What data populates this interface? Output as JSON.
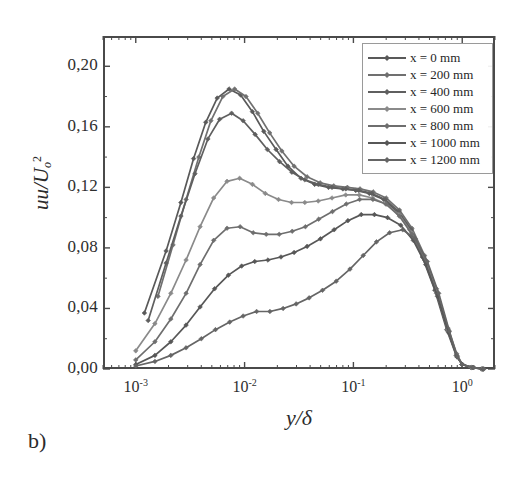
{
  "figure": {
    "panel_label": "b)",
    "background_color": "#ffffff",
    "frame_color": "#4a4a4a"
  },
  "chart_data": {
    "type": "line",
    "title": "",
    "subtitle": "",
    "xlabel": "y/δ",
    "ylabel": "uu/Uₒ²",
    "xscale": "log",
    "yscale": "linear",
    "xlim": [
      0.0005,
      2.0
    ],
    "ylim": [
      0.0,
      0.22
    ],
    "grid": false,
    "legend_position": "upper-right",
    "xtick_labels": [
      "10⁻³",
      "10⁻²",
      "10⁻¹",
      "10⁰"
    ],
    "xtick_values": [
      0.001,
      0.01,
      0.1,
      1.0
    ],
    "ytick_labels": [
      "0,00",
      "0,04",
      "0,08",
      "0,12",
      "0,16",
      "0,20"
    ],
    "ytick_values": [
      0.0,
      0.04,
      0.08,
      0.12,
      0.16,
      0.2
    ],
    "marker": "diamond",
    "series": [
      {
        "name": "x = 0 mm",
        "color": "#595959",
        "x": [
          0.0012,
          0.0019,
          0.0026,
          0.0034,
          0.0044,
          0.0056,
          0.0072,
          0.0092,
          0.0118,
          0.015,
          0.0195,
          0.025,
          0.033,
          0.044,
          0.059,
          0.08,
          0.105,
          0.14,
          0.19,
          0.25,
          0.33,
          0.43,
          0.56,
          0.72,
          0.88,
          1.0,
          1.2,
          1.5
        ],
        "y": [
          0.037,
          0.078,
          0.11,
          0.139,
          0.163,
          0.179,
          0.185,
          0.181,
          0.17,
          0.157,
          0.145,
          0.134,
          0.126,
          0.122,
          0.12,
          0.119,
          0.118,
          0.116,
          0.112,
          0.104,
          0.092,
          0.074,
          0.052,
          0.026,
          0.009,
          0.003,
          0.001,
          0.0
        ]
      },
      {
        "name": "x = 200 mm",
        "color": "#707070",
        "x": [
          0.0016,
          0.0022,
          0.0029,
          0.0038,
          0.0049,
          0.0063,
          0.0081,
          0.0103,
          0.0132,
          0.017,
          0.022,
          0.0285,
          0.0375,
          0.0495,
          0.066,
          0.088,
          0.115,
          0.152,
          0.2,
          0.265,
          0.345,
          0.45,
          0.58,
          0.74,
          0.89,
          1.0,
          1.25,
          1.55
        ],
        "y": [
          0.048,
          0.082,
          0.112,
          0.14,
          0.164,
          0.18,
          0.185,
          0.18,
          0.169,
          0.156,
          0.144,
          0.134,
          0.127,
          0.123,
          0.121,
          0.12,
          0.119,
          0.117,
          0.113,
          0.105,
          0.093,
          0.075,
          0.053,
          0.027,
          0.01,
          0.003,
          0.001,
          0.0
        ]
      },
      {
        "name": "x = 400 mm",
        "color": "#5f5f5f",
        "x": [
          0.0013,
          0.0019,
          0.0026,
          0.0035,
          0.0046,
          0.0059,
          0.0076,
          0.0097,
          0.0125,
          0.0162,
          0.021,
          0.0272,
          0.0358,
          0.0475,
          0.0635,
          0.085,
          0.112,
          0.148,
          0.196,
          0.26,
          0.34,
          0.445,
          0.575,
          0.735,
          0.885,
          1.0,
          1.22,
          1.52
        ],
        "y": [
          0.032,
          0.07,
          0.101,
          0.129,
          0.152,
          0.165,
          0.169,
          0.164,
          0.155,
          0.145,
          0.137,
          0.13,
          0.125,
          0.122,
          0.12,
          0.119,
          0.118,
          0.116,
          0.112,
          0.104,
          0.092,
          0.074,
          0.052,
          0.026,
          0.009,
          0.003,
          0.001,
          0.0
        ]
      },
      {
        "name": "x = 600 mm",
        "color": "#8a8a8a",
        "x": [
          0.001,
          0.0015,
          0.0021,
          0.0029,
          0.0039,
          0.0052,
          0.0069,
          0.009,
          0.0118,
          0.0155,
          0.0205,
          0.027,
          0.0358,
          0.0475,
          0.0635,
          0.085,
          0.113,
          0.15,
          0.198,
          0.262,
          0.342,
          0.448,
          0.578,
          0.738,
          0.888,
          1.0,
          1.23,
          1.53
        ],
        "y": [
          0.012,
          0.03,
          0.05,
          0.072,
          0.094,
          0.113,
          0.124,
          0.126,
          0.122,
          0.116,
          0.112,
          0.11,
          0.11,
          0.111,
          0.113,
          0.115,
          0.115,
          0.113,
          0.109,
          0.102,
          0.09,
          0.073,
          0.051,
          0.026,
          0.009,
          0.003,
          0.001,
          0.0
        ]
      },
      {
        "name": "x = 800 mm",
        "color": "#6e6e6e",
        "x": [
          0.001,
          0.0015,
          0.0021,
          0.0029,
          0.0039,
          0.0052,
          0.0069,
          0.0091,
          0.012,
          0.0158,
          0.0208,
          0.0274,
          0.0362,
          0.048,
          0.0642,
          0.086,
          0.114,
          0.151,
          0.2,
          0.264,
          0.345,
          0.45,
          0.58,
          0.74,
          0.89,
          1.0,
          1.24,
          1.54
        ],
        "y": [
          0.006,
          0.018,
          0.033,
          0.05,
          0.069,
          0.085,
          0.093,
          0.094,
          0.09,
          0.089,
          0.089,
          0.091,
          0.094,
          0.099,
          0.104,
          0.109,
          0.112,
          0.112,
          0.109,
          0.101,
          0.089,
          0.072,
          0.05,
          0.025,
          0.009,
          0.003,
          0.001,
          0.0
        ]
      },
      {
        "name": "x = 1000 mm",
        "color": "#575757",
        "x": [
          0.001,
          0.0015,
          0.0021,
          0.0029,
          0.0039,
          0.0053,
          0.0071,
          0.0094,
          0.0124,
          0.0164,
          0.0216,
          0.0285,
          0.0375,
          0.0498,
          0.0665,
          0.089,
          0.118,
          0.156,
          0.206,
          0.272,
          0.355,
          0.462,
          0.592,
          0.75,
          0.895,
          1.0,
          1.26,
          1.56
        ],
        "y": [
          0.003,
          0.009,
          0.018,
          0.029,
          0.041,
          0.053,
          0.062,
          0.068,
          0.071,
          0.072,
          0.074,
          0.077,
          0.081,
          0.086,
          0.092,
          0.098,
          0.102,
          0.102,
          0.1,
          0.095,
          0.085,
          0.069,
          0.048,
          0.024,
          0.008,
          0.003,
          0.001,
          0.0
        ]
      },
      {
        "name": "x = 1200 mm",
        "color": "#656565",
        "x": [
          0.001,
          0.0015,
          0.0021,
          0.0029,
          0.004,
          0.0054,
          0.0073,
          0.0097,
          0.0129,
          0.0171,
          0.0226,
          0.0298,
          0.0392,
          0.052,
          0.0695,
          0.093,
          0.123,
          0.163,
          0.215,
          0.284,
          0.37,
          0.478,
          0.608,
          0.762,
          0.9,
          1.0,
          1.28,
          1.58
        ],
        "y": [
          0.002,
          0.005,
          0.009,
          0.014,
          0.02,
          0.026,
          0.031,
          0.035,
          0.038,
          0.038,
          0.04,
          0.043,
          0.047,
          0.052,
          0.058,
          0.066,
          0.075,
          0.084,
          0.09,
          0.092,
          0.086,
          0.071,
          0.05,
          0.025,
          0.008,
          0.003,
          0.001,
          0.0
        ]
      }
    ]
  },
  "legend": {
    "entries": [
      {
        "label": "x = 0 mm"
      },
      {
        "label": "x = 200 mm"
      },
      {
        "label": "x = 400 mm"
      },
      {
        "label": "x = 600 mm"
      },
      {
        "label": "x = 800 mm"
      },
      {
        "label": "x = 1000 mm"
      },
      {
        "label": "x = 1200 mm"
      }
    ]
  },
  "axes": {
    "y_title_main": "uu/U",
    "y_title_sub": "o",
    "y_title_sup": "2",
    "x_title": "y/δ"
  }
}
